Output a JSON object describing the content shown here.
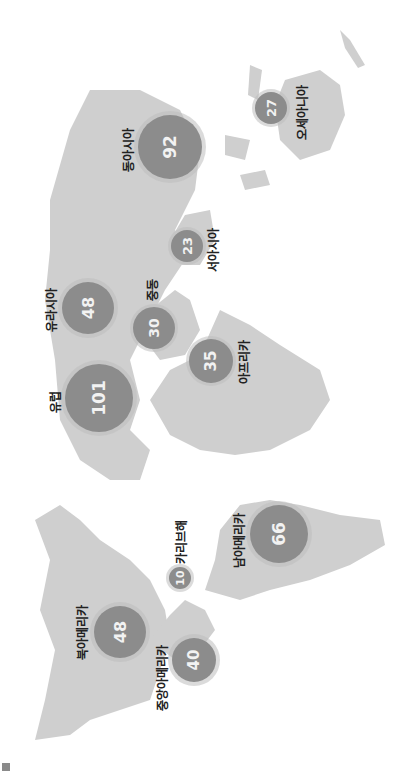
{
  "map": {
    "orientation": "rotated-90-ccw",
    "colors": {
      "land": "#cfcfcf",
      "bubble": "#8c8c8c",
      "label": "#222222",
      "value": "#f2f2f2"
    },
    "regions": [
      {
        "id": "north-america",
        "name": "북아메리카",
        "value": "48"
      },
      {
        "id": "central-america",
        "name": "중앙아메리카",
        "value": "40"
      },
      {
        "id": "caribbean",
        "name": "카리브해",
        "value": "10"
      },
      {
        "id": "south-america",
        "name": "남아메리카",
        "value": "66"
      },
      {
        "id": "europe",
        "name": "유럽",
        "value": "101"
      },
      {
        "id": "eurasia",
        "name": "유라시아",
        "value": "48"
      },
      {
        "id": "middle-east",
        "name": "중동",
        "value": "30"
      },
      {
        "id": "africa",
        "name": "아프리카",
        "value": "35"
      },
      {
        "id": "west-asia",
        "name": "서아시아",
        "value": "23"
      },
      {
        "id": "east-asia",
        "name": "동아시아",
        "value": "92"
      },
      {
        "id": "oceania",
        "name": "오세아니아",
        "value": "27"
      }
    ]
  }
}
